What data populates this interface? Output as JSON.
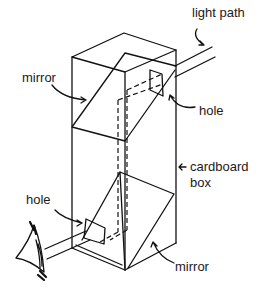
{
  "diagram": {
    "type": "periscope-sketch",
    "labels": {
      "light_path": "light path",
      "mirror_top": "mirror",
      "hole_top": "hole",
      "cardboard_box_line1": "cardboard",
      "cardboard_box_line2": "box",
      "hole_bottom": "hole",
      "mirror_bottom": "mirror"
    },
    "colors": {
      "ink": "#111111",
      "background": "#ffffff"
    }
  }
}
